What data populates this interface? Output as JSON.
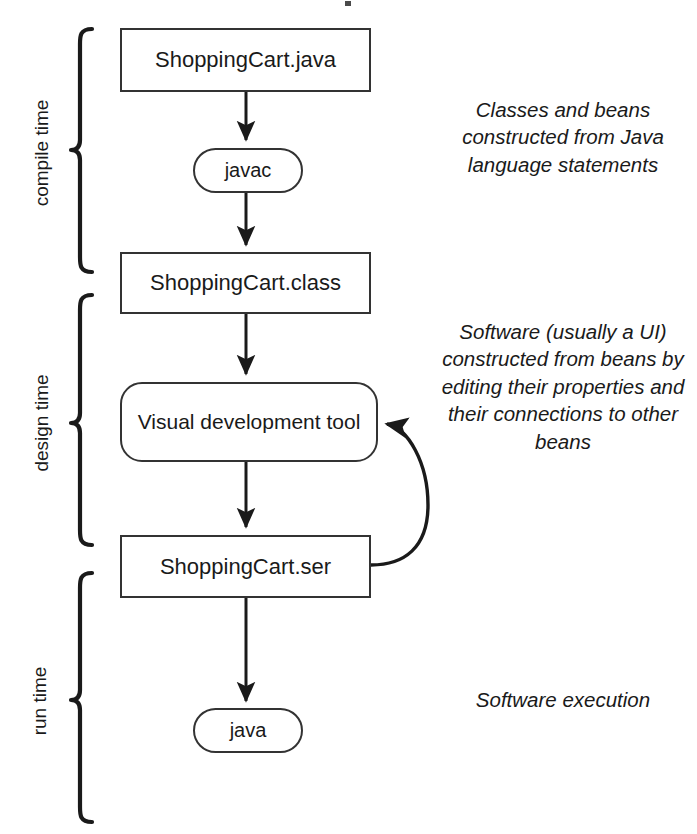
{
  "diagram": {
    "stroke_color": "#333333",
    "text_color": "#1a1a1a",
    "background_color": "#ffffff",
    "nodes": [
      {
        "id": "shoppingcart-java",
        "label": "ShoppingCart.java",
        "shape": "rect"
      },
      {
        "id": "javac",
        "label": "javac",
        "shape": "pill"
      },
      {
        "id": "shoppingcart-class",
        "label": "ShoppingCart.class",
        "shape": "rect"
      },
      {
        "id": "visual-tool",
        "label": "Visual development tool",
        "shape": "rounded-rect"
      },
      {
        "id": "shoppingcart-ser",
        "label": "ShoppingCart.ser",
        "shape": "rect"
      },
      {
        "id": "java",
        "label": "java",
        "shape": "pill"
      }
    ],
    "phases": [
      {
        "id": "compile",
        "label": "compile time"
      },
      {
        "id": "design",
        "label": "design time"
      },
      {
        "id": "run",
        "label": "run time"
      }
    ],
    "annotations": [
      {
        "id": "compile",
        "text": "Classes and beans constructed from Java language statements"
      },
      {
        "id": "design",
        "text": "Software (usually a UI) constructed from beans by editing their properties and their connections to other beans"
      },
      {
        "id": "run",
        "text": "Software execution"
      }
    ],
    "edges": [
      {
        "from": "shoppingcart-java",
        "to": "javac",
        "style": "straight-down"
      },
      {
        "from": "javac",
        "to": "shoppingcart-class",
        "style": "straight-down"
      },
      {
        "from": "shoppingcart-class",
        "to": "visual-tool",
        "style": "straight-down"
      },
      {
        "from": "visual-tool",
        "to": "shoppingcart-ser",
        "style": "straight-down"
      },
      {
        "from": "shoppingcart-ser",
        "to": "visual-tool",
        "style": "curved-feedback-right"
      },
      {
        "from": "shoppingcart-ser",
        "to": "java",
        "style": "straight-down"
      }
    ]
  }
}
